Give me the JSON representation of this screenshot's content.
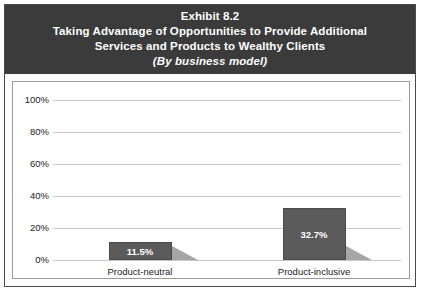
{
  "title": {
    "line1": "Exhibit 8.2",
    "line2": "Taking Advantage of Opportunities to Provide Additional",
    "line3": "Services and Products to Wealthy Clients",
    "line4": "(By business model)"
  },
  "colors": {
    "header_background": "#3b3b3b",
    "header_text": "#ffffff",
    "bar_fill": "#5b5b5b",
    "bar_shadow": "#a6a6a6",
    "gridline": "#c8c8c8",
    "frame_border": "#4a4a4a",
    "panel_background": "#ffffff"
  },
  "chart_data": {
    "type": "bar",
    "xlabel": "",
    "ylabel": "",
    "categories": [
      "Product-neutral",
      "Product-inclusive"
    ],
    "values": [
      11.5,
      32.7
    ],
    "value_labels": [
      "11.5%",
      "32.7%"
    ],
    "ylim": [
      0,
      100
    ],
    "yticks": [
      0,
      20,
      40,
      60,
      80,
      100
    ],
    "ytick_labels": [
      "0%",
      "20%",
      "40%",
      "60%",
      "80%",
      "100%"
    ],
    "grid": true,
    "legend": false,
    "units": "percent"
  }
}
